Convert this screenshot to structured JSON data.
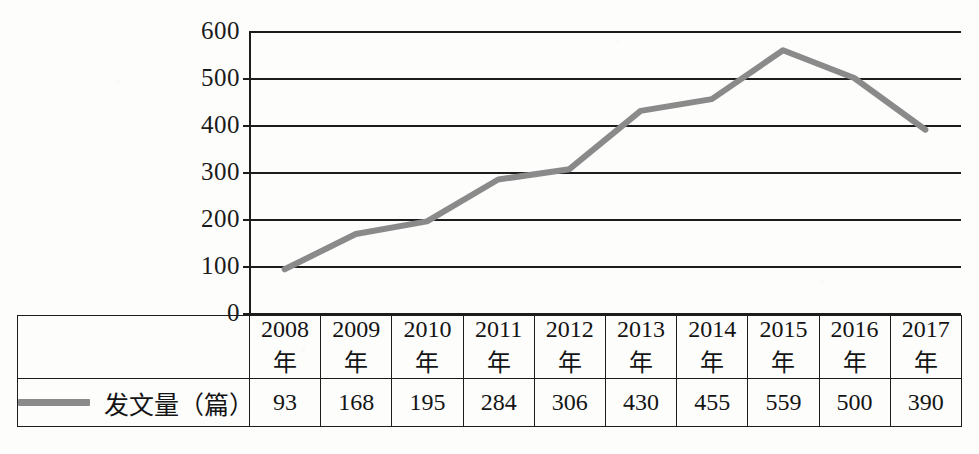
{
  "chart_data": {
    "type": "line",
    "title": "",
    "xlabel": "",
    "ylabel": "",
    "categories": [
      "2008年",
      "2009年",
      "2010年",
      "2011年",
      "2012年",
      "2013年",
      "2014年",
      "2015年",
      "2016年",
      "2017年"
    ],
    "series": [
      {
        "name": "发文量（篇）",
        "values": [
          93,
          168,
          195,
          284,
          306,
          430,
          455,
          559,
          500,
          390
        ],
        "color": "#8a8a8a"
      }
    ],
    "ylim": [
      0,
      600
    ],
    "yticks": [
      0,
      100,
      200,
      300,
      400,
      500,
      600
    ],
    "ytick_labels": [
      "0",
      "100",
      "200",
      "300",
      "400",
      "500",
      "600"
    ],
    "grid": true,
    "legend_position": "table-left"
  },
  "axis": {
    "y_tick_labels": [
      "600",
      "500",
      "400",
      "300",
      "200",
      "100",
      "0"
    ]
  },
  "table": {
    "legend": {
      "label": "发文量（篇）",
      "swatch_name": "line-swatch",
      "swatch_color": "#8a8a8a"
    },
    "header_row": [
      "2008年",
      "2009年",
      "2010年",
      "2011年",
      "2012年",
      "2013年",
      "2014年",
      "2015年",
      "2016年",
      "2017年"
    ],
    "value_row": [
      "93",
      "168",
      "195",
      "284",
      "306",
      "430",
      "455",
      "559",
      "500",
      "390"
    ]
  },
  "colors": {
    "line": "#8a8a8a",
    "axis": "#1c1c1c",
    "text": "#141414",
    "background": "#fdfdfc"
  }
}
